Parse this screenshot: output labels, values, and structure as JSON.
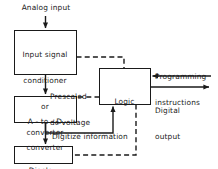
{
  "diagram": {
    "colors": {
      "line": "#1a1a1a",
      "text": "#1a1a1a",
      "background": "#ffffff"
    },
    "boxes": [
      {
        "id": "input-signal-conditioner",
        "lines": [
          "Input signal",
          "conditioner",
          "or",
          "converter"
        ],
        "x": 14,
        "y": 30,
        "w": 62,
        "h": 44
      },
      {
        "id": "a-to-d-converter",
        "lines": [
          "A - to - D",
          "converter"
        ],
        "x": 14,
        "y": 96,
        "w": 62,
        "h": 26
      },
      {
        "id": "logic",
        "lines": [
          "Logic"
        ],
        "x": 99,
        "y": 68,
        "w": 51,
        "h": 36
      },
      {
        "id": "display",
        "lines": [
          "Display"
        ],
        "x": 14,
        "y": 146,
        "w": 58,
        "h": 17
      }
    ],
    "labels": [
      {
        "id": "analog-input",
        "text": "Analog input",
        "x": 22,
        "y": 5
      },
      {
        "id": "prescaled-dc-voltage",
        "lines": [
          "Prescaled",
          "dc voltage"
        ],
        "x": 50,
        "y": 76
      },
      {
        "id": "programming-instructions",
        "lines": [
          "Programming",
          "instructions"
        ],
        "x": 155,
        "y": 58
      },
      {
        "id": "digital-output",
        "lines": [
          "Digital",
          "output"
        ],
        "x": 155,
        "y": 91
      },
      {
        "id": "digitize-information",
        "text": "Digitize information",
        "x": 52,
        "y": 134
      }
    ],
    "connections": [
      {
        "id": "analog-input-arrow",
        "style": "solid",
        "from": "analog-input-label",
        "to": "input-signal-conditioner"
      },
      {
        "id": "conditioner-to-adc",
        "style": "solid",
        "from": "input-signal-conditioner",
        "to": "a-to-d-converter"
      },
      {
        "id": "conditioner-to-logic",
        "style": "dashed",
        "from": "input-signal-conditioner",
        "to": "logic"
      },
      {
        "id": "logic-to-adc",
        "style": "dashed",
        "from": "logic",
        "to": "a-to-d-converter"
      },
      {
        "id": "adc-to-logic",
        "style": "solid",
        "from": "a-to-d-converter",
        "to": "logic"
      },
      {
        "id": "adc-to-display",
        "style": "solid",
        "from": "a-to-d-converter",
        "to": "display"
      },
      {
        "id": "logic-to-display",
        "style": "dashed",
        "from": "logic",
        "to": "display"
      },
      {
        "id": "programming-instructions-in",
        "style": "solid",
        "from": "programming-instructions",
        "to": "logic"
      },
      {
        "id": "digital-output-out",
        "style": "solid",
        "from": "logic",
        "to": "digital-output"
      }
    ]
  }
}
